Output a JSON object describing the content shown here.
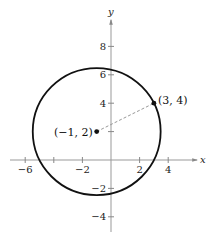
{
  "chart_data": {
    "type": "scatter",
    "title": "",
    "xlabel": "x",
    "ylabel": "y",
    "xlim": [
      -7.5,
      5.5
    ],
    "ylim": [
      -5.2,
      10.5
    ],
    "grid": false,
    "x_ticks": [
      -6,
      -4,
      -2,
      2,
      4
    ],
    "x_tick_labels": [
      "−6",
      "",
      "−2",
      "2",
      "4"
    ],
    "y_ticks": [
      8,
      6,
      4,
      2,
      -2,
      -4
    ],
    "y_tick_labels": [
      "8",
      "6",
      "4",
      "",
      "−2",
      "−4"
    ],
    "circle": {
      "center": [
        -1,
        2
      ],
      "radius": 4.472
    },
    "points": [
      {
        "x": -1,
        "y": 2,
        "label": "(−1, 2)"
      },
      {
        "x": 3,
        "y": 4,
        "label": "(3, 4)"
      }
    ],
    "segments": [
      {
        "from": [
          -1,
          2
        ],
        "to": [
          3,
          4
        ],
        "style": "dashed"
      }
    ]
  }
}
